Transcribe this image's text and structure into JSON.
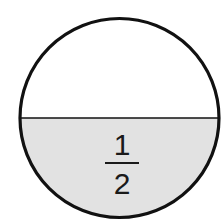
{
  "diagram": {
    "type": "fraction-circle",
    "fraction": {
      "numerator": "1",
      "denominator": "2"
    },
    "colors": {
      "background": "#ffffff",
      "outline": "#111111",
      "shaded": "#e2e2e2",
      "text": "#1a1a1a"
    }
  }
}
